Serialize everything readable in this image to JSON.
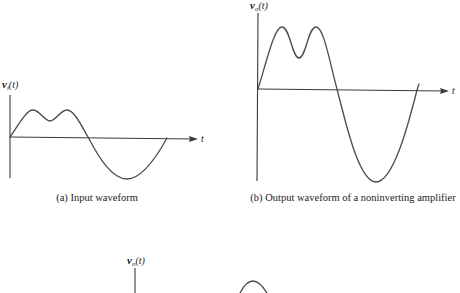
{
  "figure_a": {
    "y_label": {
      "symbol": "v",
      "subscript": "i",
      "arg": "(t)"
    },
    "x_label": "t",
    "caption": "(a) Input waveform"
  },
  "figure_b": {
    "y_label": {
      "symbol": "v",
      "subscript": "o",
      "arg": "(t)"
    },
    "x_label": "t",
    "caption": "(b) Output waveform of a noninverting amplifier"
  },
  "figure_c": {
    "y_label": {
      "symbol": "v",
      "subscript": "o",
      "arg": "(t)"
    }
  },
  "colors": {
    "axis": "#3a3a3a",
    "waveform": "#4a4a4a",
    "text": "#222222",
    "background": "#ffffff"
  }
}
